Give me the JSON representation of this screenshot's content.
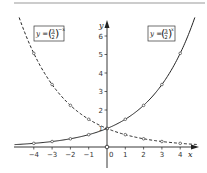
{
  "chart_data": {
    "type": "line",
    "title": "",
    "xlabel": "x",
    "ylabel": "y",
    "xlim": [
      -5,
      4.9
    ],
    "ylim": [
      0,
      6.8
    ],
    "grid": false,
    "x_ticks": [
      -4,
      -3,
      -2,
      -1,
      0,
      1,
      2,
      3,
      4
    ],
    "x_tick_labels": [
      "−4",
      "−3",
      "−2",
      "−1",
      "0",
      "1",
      "2",
      "3",
      "4"
    ],
    "y_ticks": [
      1,
      2,
      3,
      4,
      5,
      6
    ],
    "y_tick_labels": [
      "1",
      "2",
      "3",
      "4",
      "5",
      "6"
    ],
    "series": [
      {
        "name": "y = (3/2)^x",
        "style": "solid",
        "base": 1.5,
        "sign": 1,
        "marker_x": [
          -4,
          -3,
          -2,
          -1,
          0,
          1,
          2,
          3,
          4
        ],
        "marker_y": [
          0.198,
          0.296,
          0.444,
          0.667,
          1,
          1.5,
          2.25,
          3.375,
          5.0625
        ],
        "label": {
          "prefix": "y = ",
          "num": "3",
          "den": "2",
          "exp": "x",
          "position": "top-right"
        }
      },
      {
        "name": "y = (3/2)^-x",
        "style": "dashed",
        "base": 1.5,
        "sign": -1,
        "marker_x": [
          -4,
          -3,
          -2,
          -1,
          0,
          1,
          2,
          3,
          4
        ],
        "marker_y": [
          5.0625,
          3.375,
          2.25,
          1.5,
          1,
          0.667,
          0.444,
          0.296,
          0.198
        ],
        "label": {
          "prefix": "y = ",
          "num": "3",
          "den": "2",
          "exp": "−x",
          "position": "top-left"
        }
      }
    ],
    "annotations": [
      "origin open circle at (0,0)",
      "intersection at (0,1)"
    ],
    "colors": {
      "ink": "#222222",
      "background": "#ffffff"
    }
  }
}
